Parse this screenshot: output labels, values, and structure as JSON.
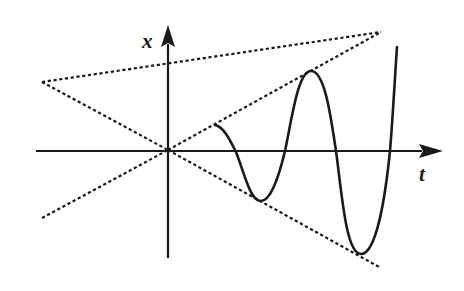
{
  "diagram": {
    "axes": {
      "vertical_label": "x",
      "horizontal_label": "t"
    },
    "colors": {
      "ink": "#1a1a1a",
      "background": "#ffffff"
    },
    "elements": {
      "envelope_lines": 2,
      "axis_arrows": 2,
      "curve": "growing oscillation"
    }
  }
}
